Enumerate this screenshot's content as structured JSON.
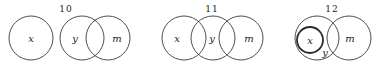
{
  "figures": [
    {
      "number": "10",
      "label_pos": [
        66,
        12
      ],
      "circles": [
        {
          "name": "x",
          "cx": 31,
          "cy": 38,
          "r": 22,
          "bold": false,
          "label_pos": [
            31,
            42
          ]
        },
        {
          "name": "y",
          "cx": 82,
          "cy": 38,
          "r": 22,
          "bold": false,
          "label_pos": [
            75,
            42
          ]
        },
        {
          "name": "m",
          "cx": 108,
          "cy": 38,
          "r": 22,
          "bold": false,
          "label_pos": [
            117,
            42
          ]
        }
      ]
    },
    {
      "number": "11",
      "label_pos": [
        212,
        12
      ],
      "circles": [
        {
          "name": "x",
          "cx": 184,
          "cy": 38,
          "r": 22,
          "bold": false,
          "label_pos": [
            177,
            42
          ]
        },
        {
          "name": "y",
          "cx": 213,
          "cy": 38,
          "r": 22,
          "bold": false,
          "label_pos": [
            212,
            42
          ]
        },
        {
          "name": "m",
          "cx": 241,
          "cy": 38,
          "r": 22,
          "bold": false,
          "label_pos": [
            249,
            42
          ]
        }
      ]
    },
    {
      "number": "12",
      "label_pos": [
        332,
        12
      ],
      "circles": [
        {
          "name": "y",
          "cx": 317,
          "cy": 38,
          "r": 22,
          "bold": false,
          "label_pos": [
            325,
            56
          ]
        },
        {
          "name": "x",
          "cx": 310,
          "cy": 40,
          "r": 13,
          "bold": true,
          "label_pos": [
            310,
            44
          ]
        },
        {
          "name": "m",
          "cx": 349,
          "cy": 38,
          "r": 22,
          "bold": false,
          "label_pos": [
            350,
            42
          ]
        }
      ]
    }
  ]
}
